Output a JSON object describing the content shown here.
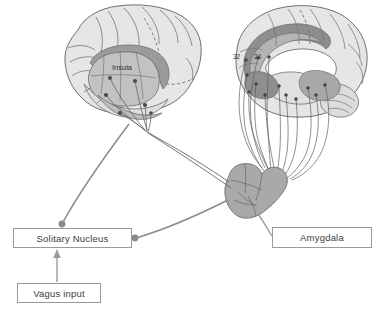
{
  "figure": {
    "background_color": "#ffffff",
    "outline_color": "#6f6f6f",
    "connector_color": "#8f8f8f",
    "node_color": "#5a5a5a",
    "cortex_fill": "#e3e3e3",
    "mid_gray_fill": "#c4c4c4",
    "dark_gray_fill": "#9e9e9e",
    "text_color": "#3c3c3c"
  },
  "boxes": [
    {
      "id": "solitary-nucleus",
      "label": "Solitary Nucleus"
    },
    {
      "id": "vagus-input",
      "label": "Vagus input"
    },
    {
      "id": "amygdala",
      "label": "Amygdala"
    }
  ],
  "brain_labels": {
    "insula": "Insula",
    "area_32": "32",
    "area_24": "24"
  },
  "brains": {
    "left": {
      "name": "left-lateral-hemisphere",
      "view": "lateral",
      "highlighted_region": "Insula"
    },
    "right": {
      "name": "right-medial-hemisphere",
      "view": "medial",
      "highlighted_regions": [
        "32",
        "24"
      ]
    }
  },
  "structures": {
    "brainstem": "brainstem-amygdala-complex"
  },
  "arrows": [
    {
      "id": "vagus-to-solitary",
      "from": "Vagus input",
      "to": "Solitary Nucleus",
      "direction": "up",
      "arrowhead": true
    }
  ],
  "connectors": [
    {
      "id": "solitary-to-insula",
      "from": "Solitary Nucleus",
      "to": "Insula"
    },
    {
      "id": "solitary-to-brainstem",
      "from": "Solitary Nucleus",
      "to": "brainstem-amygdala-complex"
    },
    {
      "id": "brainstem-to-amygdala-label",
      "from": "brainstem-amygdala-complex",
      "to": "Amygdala"
    },
    {
      "id": "brainstem-to-left-cortex",
      "from": "brainstem-amygdala-complex",
      "to": "left-lateral-hemisphere"
    },
    {
      "id": "brainstem-to-right-cortex",
      "from": "brainstem-amygdala-complex",
      "to": "right-medial-hemisphere"
    }
  ]
}
